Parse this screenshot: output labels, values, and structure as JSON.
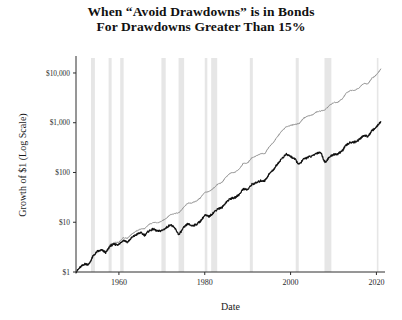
{
  "chart_data": {
    "type": "line",
    "title": "When “Avoid Drawdowns” is in Bonds For Drawdowns Greater Than 15%",
    "title_line1": "When “Avoid Drawdowns” is in Bonds",
    "title_line2": "For Drawdowns Greater Than 15%",
    "xlabel": "Date",
    "ylabel": "Growth of $1 (Log Scale)",
    "yscale": "log",
    "ylim": [
      1,
      20000
    ],
    "xlim": [
      1950,
      2022
    ],
    "grid": false,
    "legend": "none",
    "ytick_labels": [
      "$10,000",
      "$1,000",
      "$100",
      "$10",
      "$1"
    ],
    "ytick_values": [
      10000,
      1000,
      100,
      10,
      1
    ],
    "xtick_labels": [
      "1960",
      "1980",
      "2000",
      "2020"
    ],
    "xtick_values": [
      1960,
      1980,
      2000,
      2020
    ],
    "colors": {
      "avoid_drawdowns_strategy": "#8a8a8a",
      "buy_and_hold": "#111111",
      "recession_band": "#e6e6e6",
      "axis": "#2e2e2e"
    },
    "series": [
      {
        "name": "Avoid Drawdowns Strategy (in Bonds)",
        "color": "#8a8a8a",
        "x": [
          1950,
          1951,
          1952,
          1953,
          1954,
          1955,
          1956,
          1957,
          1958,
          1959,
          1960,
          1961,
          1962,
          1963,
          1964,
          1965,
          1966,
          1967,
          1968,
          1969,
          1970,
          1971,
          1972,
          1973,
          1974,
          1975,
          1976,
          1977,
          1978,
          1979,
          1980,
          1981,
          1982,
          1983,
          1984,
          1985,
          1986,
          1987,
          1988,
          1989,
          1990,
          1991,
          1992,
          1993,
          1994,
          1995,
          1996,
          1997,
          1998,
          1999,
          2000,
          2001,
          2002,
          2003,
          2004,
          2005,
          2006,
          2007,
          2008,
          2009,
          2010,
          2011,
          2012,
          2013,
          2014,
          2015,
          2016,
          2017,
          2018,
          2019,
          2020,
          2021
        ],
        "y": [
          1,
          1.25,
          1.45,
          1.45,
          2.1,
          2.6,
          2.75,
          2.6,
          3.6,
          3.9,
          3.95,
          4.9,
          4.8,
          5.8,
          6.6,
          7.3,
          7.4,
          9.0,
          9.9,
          9.7,
          10.5,
          12.0,
          14.2,
          15.0,
          15.5,
          19.5,
          24.0,
          24.5,
          26.5,
          31.0,
          40.0,
          41.0,
          48.0,
          58.0,
          63.0,
          82.0,
          97.0,
          101.0,
          117.0,
          153.0,
          155.0,
          200.0,
          215.0,
          236.0,
          240.0,
          328.0,
          402.0,
          534.0,
          686.0,
          829.0,
          880.0,
          930.0,
          960.0,
          1230.0,
          1360.0,
          1420.0,
          1640.0,
          1720.0,
          1800.0,
          2200.0,
          2530.0,
          2580.0,
          2990.0,
          3950.0,
          4480.0,
          4530.0,
          5060.0,
          6150.0,
          6000.0,
          7900.0,
          9100.0,
          12000.0
        ]
      },
      {
        "name": "Buy and Hold",
        "color": "#111111",
        "x": [
          1950,
          1951,
          1952,
          1953,
          1954,
          1955,
          1956,
          1957,
          1958,
          1959,
          1960,
          1961,
          1962,
          1963,
          1964,
          1965,
          1966,
          1967,
          1968,
          1969,
          1970,
          1971,
          1972,
          1973,
          1974,
          1975,
          1976,
          1977,
          1978,
          1979,
          1980,
          1981,
          1982,
          1983,
          1984,
          1985,
          1986,
          1987,
          1988,
          1989,
          1990,
          1991,
          1992,
          1993,
          1994,
          1995,
          1996,
          1997,
          1998,
          1999,
          2000,
          2001,
          2002,
          2003,
          2004,
          2005,
          2006,
          2007,
          2008,
          2009,
          2010,
          2011,
          2012,
          2013,
          2014,
          2015,
          2016,
          2017,
          2018,
          2019,
          2020,
          2021
        ],
        "y": [
          1,
          1.25,
          1.45,
          1.42,
          2.1,
          2.6,
          2.75,
          2.45,
          3.4,
          3.6,
          3.55,
          4.4,
          4.0,
          4.9,
          5.6,
          6.2,
          5.5,
          6.7,
          7.3,
          6.6,
          6.8,
          7.7,
          9.0,
          7.6,
          5.6,
          7.6,
          9.3,
          8.5,
          9.0,
          10.5,
          13.8,
          13.0,
          15.5,
          18.7,
          19.6,
          25.5,
          30.0,
          31.0,
          36.0,
          47.0,
          45.0,
          58.0,
          62.0,
          68.0,
          68.5,
          93.0,
          114.0,
          151.0,
          193.0,
          232.0,
          211.0,
          185.0,
          144.0,
          184.0,
          203.0,
          212.0,
          244.0,
          256.0,
          160.0,
          201.0,
          231.0,
          235.0,
          271.0,
          358.0,
          406.0,
          410.0,
          458.0,
          557.0,
          531.0,
          695.0,
          820.0,
          1050.0
        ]
      }
    ],
    "recession_bands": [
      {
        "start": 1953.5,
        "end": 1954.4
      },
      {
        "start": 1957.6,
        "end": 1958.3
      },
      {
        "start": 1960.3,
        "end": 1961.1
      },
      {
        "start": 1969.9,
        "end": 1970.9
      },
      {
        "start": 1973.9,
        "end": 1975.2
      },
      {
        "start": 1980.0,
        "end": 1980.6
      },
      {
        "start": 1981.5,
        "end": 1982.9
      },
      {
        "start": 1990.5,
        "end": 1991.2
      },
      {
        "start": 2001.2,
        "end": 2001.9
      },
      {
        "start": 2007.9,
        "end": 2009.5
      },
      {
        "start": 2020.1,
        "end": 2020.4
      }
    ]
  }
}
